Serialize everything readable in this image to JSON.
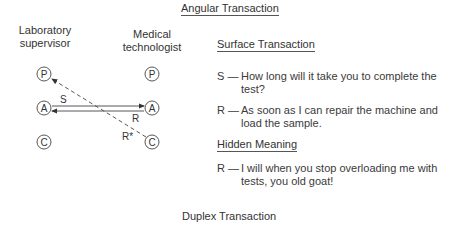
{
  "top_title": "Angular Transaction",
  "bottom_title": "Duplex Transaction",
  "diagram": {
    "left_label_line1": "Laboratory",
    "left_label_line2": "supervisor",
    "right_label_line1": "Medical",
    "right_label_line2": "technologist",
    "states": [
      "P",
      "A",
      "C"
    ],
    "arrow_labels": {
      "s": "S",
      "r": "R",
      "r_star": "R*"
    }
  },
  "surface": {
    "heading": "Surface Transaction",
    "lines": [
      {
        "key": "S —",
        "text": "How long will it take you to complete the test?"
      },
      {
        "key": "R —",
        "text": "As soon as I can repair the machine and load the sample."
      }
    ]
  },
  "hidden": {
    "heading": "Hidden Meaning",
    "lines": [
      {
        "key": "R —",
        "text": "I will when you stop overloading me with tests, you old goat!"
      }
    ]
  }
}
